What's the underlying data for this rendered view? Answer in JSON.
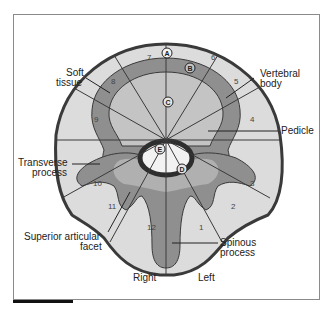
{
  "diagram": {
    "title_labels": {
      "soft_tissue": [
        "Soft",
        "tissue"
      ],
      "vertebral_body": [
        "Vertebral",
        "body"
      ],
      "pedicle": "Pedicle",
      "transverse_process": [
        "Transverse",
        "process"
      ],
      "superior_articular_facet": [
        "Superior articular",
        "facet"
      ],
      "spinous_process": [
        "Spinous",
        "process"
      ],
      "right": "Right",
      "left": "Left"
    },
    "zones": [
      "1",
      "2",
      "3",
      "4",
      "5",
      "6",
      "7",
      "8",
      "9",
      "10",
      "11",
      "12"
    ],
    "markers": [
      "A",
      "B",
      "C",
      "D",
      "E"
    ],
    "colors": {
      "soft_tissue": "#dcdcdc",
      "cortex": "#8f8f8f",
      "body": "#c4c4c4",
      "outline": "#3a3a3a",
      "canal_ring": "#2e2e2e",
      "canal": "#f2f2f2",
      "stipple": "#b8b8b8"
    }
  }
}
